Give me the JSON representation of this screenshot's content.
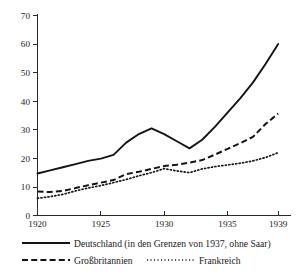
{
  "chart_data": {
    "type": "line",
    "title": "",
    "subtitle": "",
    "xlabel": "",
    "ylabel": "",
    "xlim": [
      1920,
      1939
    ],
    "ylim": [
      0,
      70
    ],
    "grid": false,
    "legend_position": "below-plot",
    "x_ticks": [
      "1920",
      "1925",
      "1930",
      "1935",
      "1939"
    ],
    "x_tick_values": [
      1920,
      1925,
      1930,
      1935,
      1939
    ],
    "y_ticks": [
      "0",
      "10",
      "20",
      "30",
      "40",
      "50",
      "60",
      "70"
    ],
    "y_tick_values": [
      0,
      10,
      20,
      30,
      40,
      50,
      60,
      70
    ],
    "x": [
      1920,
      1921,
      1922,
      1923,
      1924,
      1925,
      1926,
      1927,
      1928,
      1929,
      1930,
      1931,
      1932,
      1933,
      1934,
      1935,
      1936,
      1937,
      1938,
      1939
    ],
    "series": [
      {
        "name": "Deutschland",
        "style": "solid",
        "values": [
          14.7,
          15.8,
          16.9,
          18.0,
          19.1,
          19.9,
          21.2,
          25.5,
          28.5,
          30.5,
          28.5,
          26.0,
          23.5,
          26.5,
          31.0,
          36.0,
          41.0,
          46.5,
          53.0,
          60.0
        ]
      },
      {
        "name": "Großbritannien",
        "style": "dashed",
        "values": [
          8.4,
          8.2,
          8.6,
          9.6,
          10.6,
          11.5,
          12.4,
          14.5,
          15.3,
          16.3,
          17.3,
          17.8,
          18.5,
          19.4,
          21.3,
          23.3,
          25.3,
          27.5,
          32.0,
          35.7
        ]
      },
      {
        "name": "Frankreich",
        "style": "dotted",
        "values": [
          6.0,
          6.6,
          7.4,
          8.6,
          9.6,
          10.5,
          11.5,
          12.6,
          13.9,
          15.0,
          16.4,
          15.6,
          15.0,
          16.3,
          17.1,
          17.7,
          18.3,
          19.1,
          20.3,
          22.0
        ]
      }
    ]
  },
  "legend": {
    "entries": [
      {
        "label": "Deutschland",
        "note": "  (in den Grenzen von 1937, ohne Saar)",
        "style": "solid"
      },
      {
        "label": "Großbritannien",
        "note": "",
        "style": "dashed"
      },
      {
        "label": "Frankreich",
        "note": "",
        "style": "dotted"
      }
    ]
  },
  "colors": {
    "line": "#141414",
    "axis": "#2b2b2b",
    "text": "#1a1a1a",
    "background": "#ffffff"
  }
}
